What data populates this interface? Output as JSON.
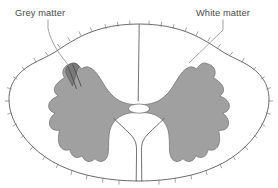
{
  "labels": {
    "grey_matter": "Grey matter",
    "white_matter": "White matter"
  },
  "colors": {
    "grey_matter_fill": "#a0a0a0",
    "white_matter_fill": "#ffffff",
    "outline_stroke": "#5a5a5a",
    "leader_stroke": "#8a8a8a",
    "text": "#4a4a4a",
    "background": "#ffffff"
  },
  "structures": [
    {
      "name": "grey-matter",
      "description": "butterfly-shaped central grey matter"
    },
    {
      "name": "white-matter",
      "description": "peripheral white matter"
    },
    {
      "name": "central-canal",
      "description": "small oval opening at centre"
    },
    {
      "name": "posterior-median-sulcus",
      "description": "vertical cleft at top midline"
    },
    {
      "name": "anterior-median-fissure",
      "description": "deep cleft at bottom midline"
    }
  ]
}
